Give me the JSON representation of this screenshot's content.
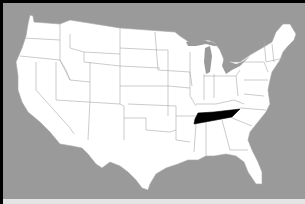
{
  "map": {
    "title": "",
    "region": "Contiguous United States",
    "highlighted_state": "Tennessee",
    "colors": {
      "background": "#9a9a9a",
      "frame": "#000000",
      "land": "#ffffff",
      "border": "#a8a8a8",
      "highlight": "#000000",
      "bottom_strip": "#e4e4e4"
    }
  }
}
